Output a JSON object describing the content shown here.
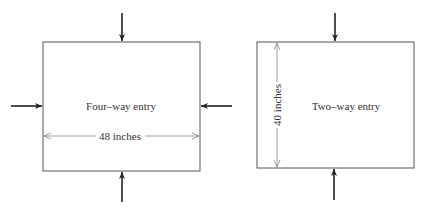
{
  "diagram": {
    "four_way": {
      "label": "Four–way entry",
      "dimension": "48 inches",
      "entries": [
        "top",
        "left",
        "right",
        "bottom"
      ]
    },
    "two_way": {
      "label": "Two–way entry",
      "dimension": "40 inches",
      "entries": [
        "top",
        "bottom"
      ]
    },
    "colors": {
      "outline": "#555555",
      "arrow": "#222222",
      "dimension_line": "#888888"
    }
  }
}
